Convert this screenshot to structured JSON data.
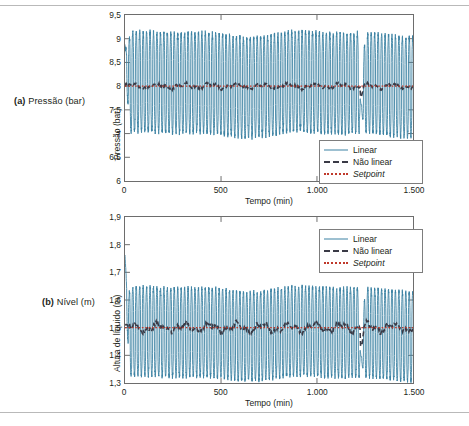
{
  "figure": {
    "captions": [
      {
        "tag": "(a)",
        "text": " Pressão (bar)"
      },
      {
        "tag": "(b)",
        "text": " Nível (m)"
      }
    ]
  },
  "colors": {
    "linear": "#3d82a3",
    "nonlinear": "#3a3a46",
    "setpoint": "#c0392b",
    "axis": "#6d6d6d",
    "rule": "#b9b9b9",
    "text": "#231f20"
  },
  "legend": {
    "position": "inside",
    "entries": [
      {
        "label": "Linear",
        "style": "solid",
        "color": "#3d82a3",
        "italic": false
      },
      {
        "label": "Não linear",
        "style": "dashed",
        "color": "#3a3a46",
        "italic": false
      },
      {
        "label": "Setpoint",
        "style": "dotted",
        "color": "#c0392b",
        "italic": true
      }
    ]
  },
  "chart_data": [
    {
      "id": "pressure",
      "type": "line",
      "title": "",
      "panel_label": "(a) Pressão (bar)",
      "xlabel": "Tempo (min)",
      "ylabel": "Pressão (bar)",
      "xlim": [
        0,
        1500
      ],
      "ylim": [
        6,
        9.5
      ],
      "xticks": [
        0,
        500,
        1000,
        1500
      ],
      "xticklabels": [
        "0",
        "500",
        "1.000",
        "1.500"
      ],
      "yticks": [
        6,
        6.5,
        7,
        7.5,
        8,
        8.5,
        9,
        9.5
      ],
      "yticklabels": [
        "6",
        "6,5",
        "7",
        "7,5",
        "8",
        "8,5",
        "9",
        "9,5"
      ],
      "grid": false,
      "decimal_separator": ",",
      "thousands_separator": ".",
      "series": [
        {
          "name": "Linear",
          "style": "solid",
          "color": "#3d82a3",
          "description": "Fast sustained oscillation (limit cycle) about the setpoint; envelope roughly 7.0 to 9.1 bar, period about 18 min, with an initial transient near t=0 reaching 8.8 and a disturbance near t=1230 where the trace dips to about 7.4 before recovering",
          "envelope_min": 7.0,
          "envelope_max": 9.1,
          "period_min": 18,
          "initial_value": 8.8,
          "disturbance_time": 1230,
          "disturbance_min": 7.4
        },
        {
          "name": "Não linear",
          "style": "dashed",
          "color": "#3a3a46",
          "description": "Nearly flat trace held at the setpoint with small ripple of about +/-0.1 bar",
          "mean": 8.0,
          "ripple": 0.1
        },
        {
          "name": "Setpoint",
          "style": "dotted",
          "color": "#c0392b",
          "description": "Constant reference line",
          "value": 8.0
        }
      ]
    },
    {
      "id": "level",
      "type": "line",
      "title": "",
      "panel_label": "(b) Nível (m)",
      "xlabel": "Tempo (min)",
      "ylabel": "Altura de líquido (m)",
      "xlim": [
        0,
        1500
      ],
      "ylim": [
        1.3,
        1.9
      ],
      "xticks": [
        0,
        500,
        1000,
        1500
      ],
      "xticklabels": [
        "0",
        "500",
        "1.000",
        "1.500"
      ],
      "yticks": [
        1.3,
        1.4,
        1.5,
        1.6,
        1.7,
        1.8,
        1.9
      ],
      "yticklabels": [
        "1,3",
        "1,4",
        "1,5",
        "1,6",
        "1,7",
        "1,8",
        "1,9"
      ],
      "grid": false,
      "decimal_separator": ",",
      "thousands_separator": ".",
      "series": [
        {
          "name": "Linear",
          "style": "solid",
          "color": "#3d82a3",
          "description": "Fast sustained oscillation about the setpoint; envelope roughly 1.32 to 1.64 m, period about 18 min, with an initial spike near t=0 reaching 1.76 and a disturbance near t=1230 where the trace dips to about 1.36",
          "envelope_min": 1.32,
          "envelope_max": 1.64,
          "period_min": 18,
          "initial_value": 1.76,
          "disturbance_time": 1230,
          "disturbance_min": 1.36
        },
        {
          "name": "Não linear",
          "style": "dashed",
          "color": "#3a3a46",
          "description": "Nearly flat trace held at the setpoint with small ripple of about +/-0.03 m",
          "mean": 1.5,
          "ripple": 0.03
        },
        {
          "name": "Setpoint",
          "style": "dotted",
          "color": "#c0392b",
          "description": "Constant reference line",
          "value": 1.5
        }
      ]
    }
  ]
}
